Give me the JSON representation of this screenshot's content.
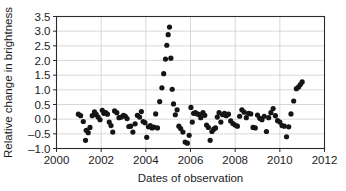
{
  "chart_data": {
    "type": "scatter",
    "title": "",
    "xlabel": "Dates of observation",
    "ylabel": "Relative change in brightness",
    "xlim": [
      2000,
      2012
    ],
    "ylim": [
      -1.0,
      3.5
    ],
    "xticks": [
      2000,
      2002,
      2004,
      2006,
      2008,
      2010,
      2012
    ],
    "xtick_labels": [
      "2000",
      "2002",
      "2004",
      "2006",
      "2008",
      "2010",
      "2012"
    ],
    "yticks": [
      -1.0,
      -0.5,
      0.0,
      0.5,
      1.0,
      1.5,
      2.0,
      2.5,
      3.0,
      3.5
    ],
    "ytick_labels": [
      "-1.0",
      "-0.5",
      "0.0",
      "0.5",
      "1.0",
      "1.5",
      "2.0",
      "2.5",
      "3.0",
      "3.5"
    ],
    "grid": true,
    "grid_axis": "both",
    "legend": false,
    "marker": "filled-circle",
    "marker_color": "#151515",
    "marker_size": 2.6,
    "series": [
      {
        "name": "Relative change in brightness",
        "x": [
          2000.98,
          2001.08,
          2001.2,
          2001.3,
          2001.33,
          2001.42,
          2001.5,
          2001.6,
          2001.7,
          2001.78,
          2001.86,
          2001.95,
          2002.05,
          2002.12,
          2002.2,
          2002.28,
          2002.36,
          2002.44,
          2002.52,
          2002.6,
          2002.7,
          2002.8,
          2002.9,
          2003.0,
          2003.08,
          2003.16,
          2003.24,
          2003.32,
          2003.42,
          2003.52,
          2003.62,
          2003.72,
          2003.8,
          2003.88,
          2003.96,
          2004.04,
          2004.12,
          2004.2,
          2004.28,
          2004.36,
          2004.44,
          2004.52,
          2004.62,
          2004.72,
          2004.8,
          2004.88,
          2004.94,
          2005.0,
          2005.06,
          2005.12,
          2005.18,
          2005.24,
          2005.32,
          2005.4,
          2005.48,
          2005.56,
          2005.66,
          2005.76,
          2005.86,
          2005.94,
          2006.02,
          2006.08,
          2006.14,
          2006.22,
          2006.3,
          2006.38,
          2006.46,
          2006.56,
          2006.64,
          2006.72,
          2006.8,
          2006.88,
          2006.96,
          2007.04,
          2007.12,
          2007.2,
          2007.28,
          2007.36,
          2007.44,
          2007.52,
          2007.6,
          2007.7,
          2007.8,
          2007.9,
          2008.0,
          2008.1,
          2008.2,
          2008.3,
          2008.4,
          2008.5,
          2008.6,
          2008.7,
          2008.8,
          2008.9,
          2009.0,
          2009.1,
          2009.2,
          2009.3,
          2009.4,
          2009.5,
          2009.6,
          2009.7,
          2009.8,
          2009.9,
          2010.0,
          2010.1,
          2010.2,
          2010.3,
          2010.4,
          2010.5,
          2010.62,
          2010.74,
          2010.84,
          2010.92,
          2011.0
        ],
        "y": [
          0.17,
          0.12,
          -0.08,
          -0.72,
          -0.38,
          -0.46,
          -0.28,
          0.12,
          0.25,
          0.16,
          0.07,
          -0.02,
          0.3,
          0.2,
          0.22,
          0.17,
          -0.1,
          -0.22,
          -0.44,
          0.28,
          0.22,
          0.05,
          0.07,
          0.13,
          0.1,
          0.02,
          -0.25,
          -0.24,
          -0.44,
          -0.16,
          0.13,
          0.07,
          0.26,
          -0.08,
          -0.12,
          -0.62,
          -0.26,
          -0.22,
          -0.3,
          -0.27,
          0.18,
          -0.3,
          0.6,
          1.07,
          1.55,
          2.05,
          2.52,
          2.88,
          3.14,
          2.08,
          1.02,
          0.52,
          0.15,
          0.32,
          -0.24,
          -0.32,
          -0.44,
          -0.78,
          -0.82,
          -0.55,
          0.4,
          -0.1,
          0.2,
          0.22,
          0.18,
          0.16,
          0.05,
          0.22,
          0.13,
          -0.2,
          -0.28,
          -0.72,
          -0.42,
          -0.34,
          -0.3,
          0.07,
          0.22,
          -0.1,
          0.15,
          0.2,
          0.12,
          0.17,
          -0.06,
          -0.15,
          -0.2,
          -0.24,
          0.1,
          0.32,
          0.24,
          0.05,
          0.2,
          0.18,
          -0.28,
          -0.3,
          0.14,
          0.03,
          -0.02,
          0.1,
          -0.42,
          0.05,
          0.22,
          0.36,
          0.12,
          -0.05,
          -0.1,
          -0.22,
          -0.24,
          -0.6,
          -0.26,
          0.18,
          0.62,
          1.04,
          1.1,
          1.18,
          1.27
        ]
      }
    ]
  }
}
